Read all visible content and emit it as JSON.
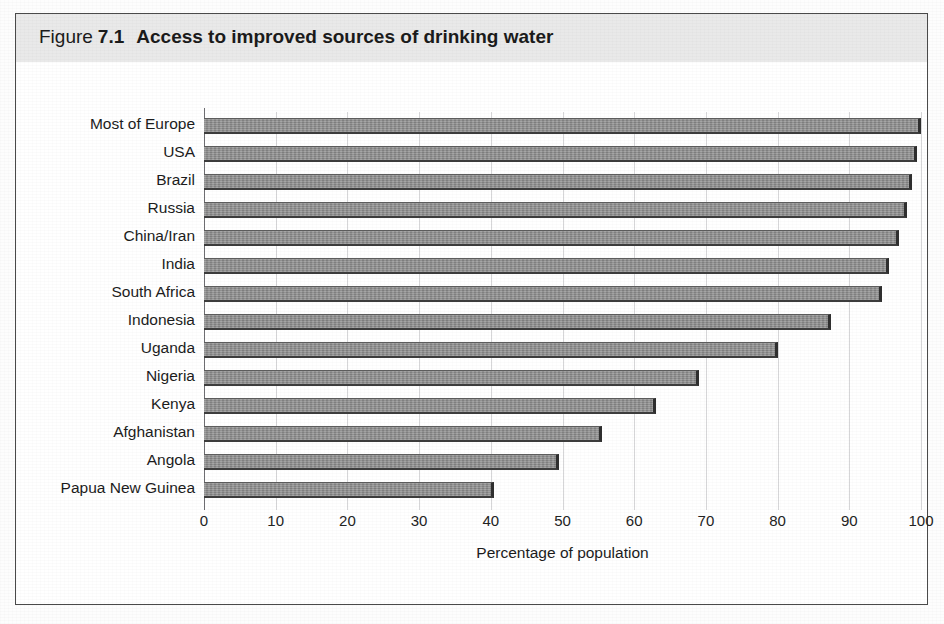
{
  "figure": {
    "label": "Figure",
    "number": "7.1",
    "title": "Access to improved sources of drinking water"
  },
  "chart_data": {
    "type": "bar",
    "orientation": "horizontal",
    "title": "Access to improved sources of drinking water",
    "xlabel": "Percentage of population",
    "ylabel": "",
    "xlim": [
      0,
      100
    ],
    "xticks": [
      0,
      10,
      20,
      30,
      40,
      50,
      60,
      70,
      80,
      90,
      100
    ],
    "grid": "vertical",
    "legend": "none",
    "bar_color": "#8e8e8e",
    "categories": [
      "Most of Europe",
      "USA",
      "Brazil",
      "Russia",
      "China/Iran",
      "India",
      "South Africa",
      "Indonesia",
      "Uganda",
      "Nigeria",
      "Kenya",
      "Afghanistan",
      "Angola",
      "Papua New Guinea"
    ],
    "values": [
      100,
      99.5,
      98.7,
      98,
      97,
      95.5,
      94.5,
      87.5,
      80,
      69,
      63,
      55.5,
      49.5,
      40.5
    ]
  }
}
